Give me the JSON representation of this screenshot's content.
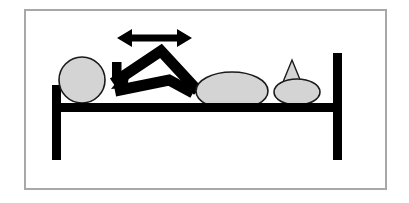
{
  "figure": {
    "title": "Patient lying supine on bed with knees bent, bridging/rocking motion indicated",
    "canvas": {
      "width": 409,
      "height": 203
    },
    "background_color": "#FFFFFF",
    "ink_color": "#000000",
    "fill_color": "#D4D4D4",
    "border_color": "#A8A8A8",
    "outline_color": "#1A1A1A"
  },
  "border": {
    "name": "image-border",
    "x": 24,
    "y": 9,
    "width": 363,
    "height": 181,
    "stroke_width": 2
  },
  "bed": {
    "name": "bed-frame",
    "rail": {
      "x": 52,
      "y": 103,
      "width": 290,
      "height": 9
    },
    "left_leg": {
      "x": 52,
      "y": 85,
      "width": 9,
      "height": 75
    },
    "right_leg": {
      "x": 333,
      "y": 53,
      "width": 9,
      "height": 107
    }
  },
  "body_parts": {
    "head": {
      "name": "head-ellipse",
      "cx": 82,
      "cy": 80,
      "rx": 23,
      "ry": 23
    },
    "torso": {
      "name": "torso-ellipse",
      "cx": 232,
      "cy": 91,
      "rx": 36,
      "ry": 19
    },
    "pillow": {
      "name": "pillow-ellipse",
      "cx": 297,
      "cy": 92,
      "rx": 23,
      "ry": 13
    },
    "pillow_fold": {
      "name": "pillow-fold-triangle",
      "points": "292,61 300,79 285,79"
    },
    "leg_upper": {
      "name": "upper-leg-polyline",
      "points": "113,83 161,51 198,91",
      "stroke_width": 11
    },
    "leg_lower": {
      "name": "lower-leg-polyline",
      "points": "115,91 169,80 193,93",
      "stroke_width": 11
    }
  },
  "annotations": {
    "motion_arrow": {
      "name": "horizontal-double-arrow",
      "label": "back-and-forth motion",
      "points": "117,38 131,30 131,35 178,35 178,30 192,38 178,46 178,41 131,41 131,46",
      "x_left": 117,
      "x_right": 192,
      "y_center": 38
    },
    "hip_arrow": {
      "name": "down-left-arrow",
      "label": "downward pressure at hips",
      "points": "112,63 121,63 121,79 129,73 126,86 112,89 116,81 112,81"
    }
  }
}
